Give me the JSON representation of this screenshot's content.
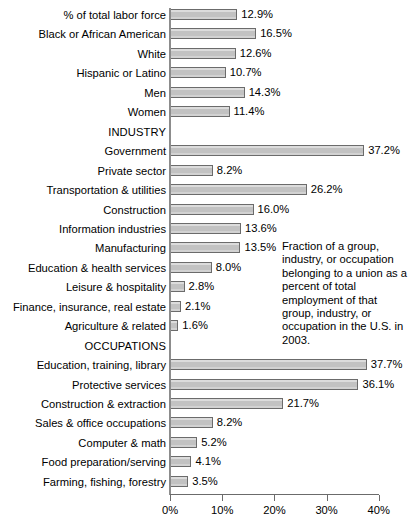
{
  "chart_data": {
    "type": "bar",
    "orientation": "horizontal",
    "title": "",
    "xlabel": "",
    "ylabel": "",
    "xlim": [
      0,
      40
    ],
    "grid": false,
    "axis_ticks": [
      "0%",
      "10%",
      "20%",
      "30%",
      "40%"
    ],
    "axis_tick_values": [
      0,
      10,
      20,
      30,
      40
    ],
    "categories": [
      "% of total labor force",
      "Black or African American",
      "White",
      "Hispanic or Latino",
      "Men",
      "Women",
      "INDUSTRY",
      "Government",
      "Private sector",
      "Transportation & utilities",
      "Construction",
      "Information industries",
      "Manufacturing",
      "Education & health services",
      "Leisure & hospitality",
      "Finance, insurance, real estate",
      "Agriculture & related",
      "OCCUPATIONS",
      "Education, training, library",
      "Protective services",
      "Construction & extraction",
      "Sales & office occupations",
      "Computer & math",
      "Food preparation/serving",
      "Farming, fishing, forestry"
    ],
    "values": [
      12.9,
      16.5,
      12.6,
      10.7,
      14.3,
      11.4,
      null,
      37.2,
      8.2,
      26.2,
      16.0,
      13.6,
      13.5,
      8.0,
      2.8,
      2.1,
      1.6,
      null,
      37.7,
      36.1,
      21.7,
      8.2,
      5.2,
      4.1,
      3.5
    ],
    "value_labels": [
      "12.9%",
      "16.5%",
      "12.6%",
      "10.7%",
      "14.3%",
      "11.4%",
      "",
      "37.2%",
      "8.2%",
      "26.2%",
      "16.0%",
      "13.6%",
      "13.5%",
      "8.0%",
      "2.8%",
      "2.1%",
      "1.6%",
      "",
      "37.7%",
      "36.1%",
      "21.7%",
      "8.2%",
      "5.2%",
      "4.1%",
      "3.5%"
    ],
    "section_headers": [
      "INDUSTRY",
      "OCCUPATIONS"
    ],
    "annotation": "Fraction of a group, industry, or occupation belonging to a union as a percent of total employment of that group, industry, or occupation in the U.S. in 2003.",
    "colors": {
      "bar_fill": "#c9c9c9",
      "bar_border": "#6b6b6b",
      "axis": "#6b6b6b",
      "text": "#000000",
      "background": "#ffffff"
    }
  }
}
